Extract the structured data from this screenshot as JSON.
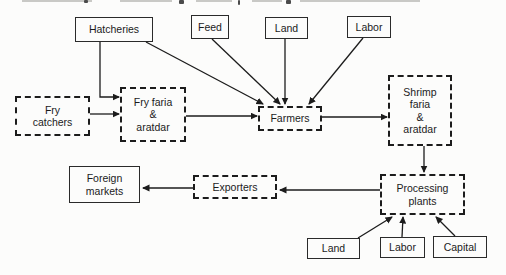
{
  "diagram": {
    "background": "#fcfcfb",
    "line_color": "#1c1c1c",
    "nodes": [
      {
        "id": "hatcheries",
        "label": [
          "Hatcheries"
        ],
        "shape": "solid",
        "x": 75,
        "y": 17,
        "w": 78,
        "h": 25
      },
      {
        "id": "feed",
        "label": [
          "Feed"
        ],
        "shape": "solid",
        "x": 191,
        "y": 15,
        "w": 38,
        "h": 24
      },
      {
        "id": "land-input",
        "label": [
          "Land"
        ],
        "shape": "solid",
        "x": 265,
        "y": 17,
        "w": 43,
        "h": 22
      },
      {
        "id": "labor-input",
        "label": [
          "Labor"
        ],
        "shape": "solid",
        "x": 347,
        "y": 16,
        "w": 44,
        "h": 22
      },
      {
        "id": "fry-catchers",
        "label": [
          "Fry",
          "catchers"
        ],
        "shape": "dashed",
        "x": 15,
        "y": 96,
        "w": 75,
        "h": 40
      },
      {
        "id": "fry-faria-aratdar",
        "label": [
          "Fry faria",
          "&",
          "aratdar"
        ],
        "shape": "dashed",
        "x": 120,
        "y": 87,
        "w": 66,
        "h": 55
      },
      {
        "id": "farmers",
        "label": [
          "Farmers"
        ],
        "shape": "dashed",
        "x": 258,
        "y": 106,
        "w": 64,
        "h": 25
      },
      {
        "id": "shrimp-faria-aratdar",
        "label": [
          "Shrimp",
          "faria",
          "&",
          "aratdar"
        ],
        "shape": "dashed",
        "x": 388,
        "y": 75,
        "w": 64,
        "h": 71
      },
      {
        "id": "foreign-markets",
        "label": [
          "Foreign",
          "markets"
        ],
        "shape": "solid",
        "x": 69,
        "y": 166,
        "w": 71,
        "h": 37
      },
      {
        "id": "exporters",
        "label": [
          "Exporters"
        ],
        "shape": "dashed",
        "x": 193,
        "y": 175,
        "w": 84,
        "h": 24
      },
      {
        "id": "processing-plants",
        "label": [
          "Processing",
          "plants"
        ],
        "shape": "dashed",
        "x": 380,
        "y": 174,
        "w": 85,
        "h": 41
      },
      {
        "id": "land-processing",
        "label": [
          "Land"
        ],
        "shape": "solid",
        "x": 307,
        "y": 238,
        "w": 53,
        "h": 21
      },
      {
        "id": "labor-processing",
        "label": [
          "Labor"
        ],
        "shape": "solid",
        "x": 380,
        "y": 237,
        "w": 45,
        "h": 21
      },
      {
        "id": "capital-processing",
        "label": [
          "Capital"
        ],
        "shape": "solid",
        "x": 433,
        "y": 236,
        "w": 54,
        "h": 22
      }
    ],
    "edges": [
      {
        "id": "hatcheries-to-fry-faria",
        "points": [
          [
            100,
            42
          ],
          [
            100,
            97
          ],
          [
            119,
            97
          ]
        ]
      },
      {
        "id": "fry-catchers-to-fry-faria",
        "points": [
          [
            90,
            114
          ],
          [
            119,
            114
          ]
        ]
      },
      {
        "id": "hatcheries-to-farmers",
        "points": [
          [
            146,
            42
          ],
          [
            263,
            104
          ]
        ]
      },
      {
        "id": "feed-to-farmers",
        "points": [
          [
            212,
            39
          ],
          [
            280,
            104
          ]
        ]
      },
      {
        "id": "land-to-farmers",
        "points": [
          [
            285,
            39
          ],
          [
            285,
            104
          ]
        ]
      },
      {
        "id": "labor-to-farmers",
        "points": [
          [
            363,
            38
          ],
          [
            309,
            104
          ]
        ]
      },
      {
        "id": "fry-faria-to-farmers",
        "points": [
          [
            186,
            116
          ],
          [
            257,
            116
          ]
        ]
      },
      {
        "id": "farmers-to-shrimp-faria",
        "points": [
          [
            322,
            117
          ],
          [
            387,
            117
          ]
        ]
      },
      {
        "id": "shrimp-faria-to-processing",
        "points": [
          [
            424,
            146
          ],
          [
            424,
            172
          ]
        ]
      },
      {
        "id": "processing-to-exporters",
        "points": [
          [
            380,
            190
          ],
          [
            280,
            190
          ]
        ]
      },
      {
        "id": "exporters-to-foreign-markets",
        "points": [
          [
            193,
            188
          ],
          [
            143,
            188
          ]
        ]
      },
      {
        "id": "land-processing-to-processing",
        "points": [
          [
            358,
            238
          ],
          [
            392,
            217
          ]
        ]
      },
      {
        "id": "labor-processing-to-processing",
        "points": [
          [
            402,
            237
          ],
          [
            403,
            217
          ]
        ]
      },
      {
        "id": "capital-processing-to-processing",
        "points": [
          [
            455,
            236
          ],
          [
            436,
            217
          ]
        ]
      }
    ]
  }
}
